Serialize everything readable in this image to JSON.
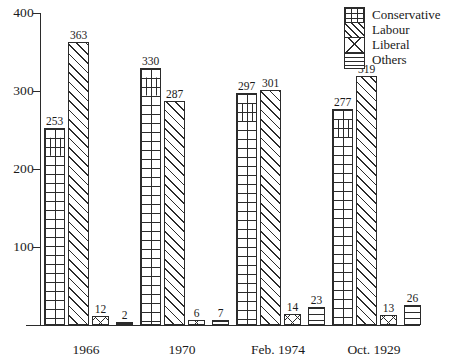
{
  "chart_data": {
    "type": "bar",
    "title": "",
    "xlabel": "",
    "ylabel": "",
    "ylim": [
      0,
      400
    ],
    "yticks": [
      100,
      200,
      300,
      400
    ],
    "grid": false,
    "legend_position": "top-right",
    "categories": [
      "1966",
      "1970",
      "Feb. 1974",
      "Oct. 1929"
    ],
    "series": [
      {
        "name": "Conservative",
        "pattern": "brick",
        "values": [
          253,
          330,
          297,
          277
        ]
      },
      {
        "name": "Labour",
        "pattern": "diagonal",
        "values": [
          363,
          287,
          301,
          319
        ]
      },
      {
        "name": "Liberal",
        "pattern": "cross",
        "values": [
          12,
          6,
          14,
          13
        ]
      },
      {
        "name": "Others",
        "pattern": "horizontal",
        "values": [
          2,
          7,
          23,
          26
        ]
      }
    ]
  },
  "axis": {
    "yticks": [
      {
        "label": "400"
      },
      {
        "label": "300"
      },
      {
        "label": "200"
      },
      {
        "label": "100"
      }
    ]
  },
  "legend": {
    "entries": [
      {
        "label": "Conservative"
      },
      {
        "label": "Labour"
      },
      {
        "label": "Liberal"
      },
      {
        "label": "Others"
      }
    ]
  },
  "groups": [
    {
      "label": "1966",
      "bars": [
        {
          "series": "Conservative",
          "value": 253,
          "text": "253"
        },
        {
          "series": "Labour",
          "value": 363,
          "text": "363"
        },
        {
          "series": "Liberal",
          "value": 12,
          "text": "12"
        },
        {
          "series": "Others",
          "value": 2,
          "text": "2"
        }
      ]
    },
    {
      "label": "1970",
      "bars": [
        {
          "series": "Conservative",
          "value": 330,
          "text": "330"
        },
        {
          "series": "Labour",
          "value": 287,
          "text": "287"
        },
        {
          "series": "Liberal",
          "value": 6,
          "text": "6"
        },
        {
          "series": "Others",
          "value": 7,
          "text": "7"
        }
      ]
    },
    {
      "label": "Feb. 1974",
      "bars": [
        {
          "series": "Conservative",
          "value": 297,
          "text": "297"
        },
        {
          "series": "Labour",
          "value": 301,
          "text": "301"
        },
        {
          "series": "Liberal",
          "value": 14,
          "text": "14"
        },
        {
          "series": "Others",
          "value": 23,
          "text": "23"
        }
      ]
    },
    {
      "label": "Oct. 1929",
      "bars": [
        {
          "series": "Conservative",
          "value": 277,
          "text": "277"
        },
        {
          "series": "Labour",
          "value": 319,
          "text": "319"
        },
        {
          "series": "Liberal",
          "value": 13,
          "text": "13"
        },
        {
          "series": "Others",
          "value": 26,
          "text": "26"
        }
      ]
    }
  ],
  "colors": {
    "ink": "#2b2b2b",
    "background": "#ffffff"
  }
}
